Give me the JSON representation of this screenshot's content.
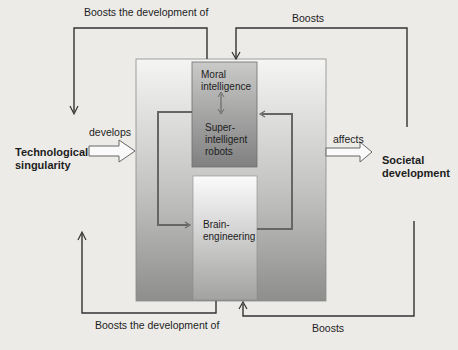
{
  "diagram": {
    "nodes": {
      "tech_singularity": "Technological singularity",
      "tech_singularity_l1": "Technological",
      "tech_singularity_l2": "singularity",
      "societal_development_l1": "Societal",
      "societal_development_l2": "development",
      "moral_intelligence_l1": "Moral",
      "moral_intelligence_l2": "intelligence",
      "super_robots_l1": "Super-",
      "super_robots_l2": "intelligent",
      "super_robots_l3": "robots",
      "brain_eng_l1": "Brain-",
      "brain_eng_l2": "engineering"
    },
    "edges": {
      "top_left": "Boosts the development of",
      "top_right": "Boosts",
      "develops": "develops",
      "affects": "affects",
      "bottom_left": "Boosts the development of",
      "bottom_right": "Boosts"
    },
    "colors": {
      "frame_top": "#f4f4f3",
      "frame_bottom": "#8d8d8b",
      "upper_box_top": "#c9c9c8",
      "upper_box_bottom": "#7f7f7e",
      "lower_box_top": "#fbfbfb",
      "lower_box_bottom": "#a3a3a2",
      "line": "#555555"
    }
  }
}
